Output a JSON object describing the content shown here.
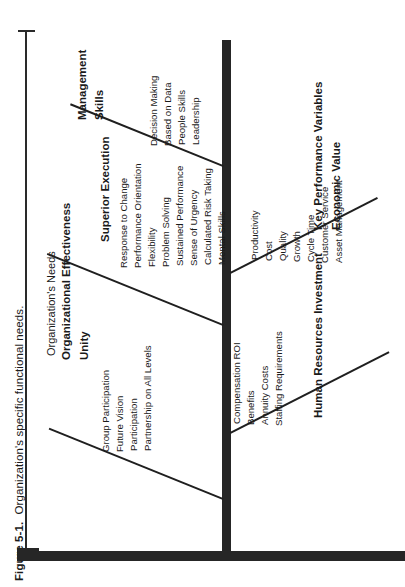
{
  "caption": {
    "figure_label": "Figure 5-1.",
    "text": "Organization's specific functional needs."
  },
  "bracket": {
    "label": "Organization's Needs"
  },
  "diagram": {
    "type": "fishbone",
    "orientation": "rotated-90-ccw",
    "groups": [
      {
        "id": "organizational-effectiveness",
        "header": "Organizational Effectiveness",
        "side": "left",
        "branches": [
          {
            "id": "management-skills",
            "title_line1": "Management",
            "title_line2": "Skills",
            "items": [
              "Decision Making",
              "Based on Data",
              "People Skills",
              "Leadership"
            ]
          },
          {
            "id": "superior-execution",
            "title_line1": "Superior Execution",
            "title_line2": "",
            "items": [
              "Response to Change",
              "Performance Orientation",
              "Flexibility",
              "Problem Solving",
              "Sustained Performance",
              "Sense of Urgency",
              "Calculated Risk Taking",
              "Mental Skills"
            ]
          },
          {
            "id": "unity",
            "title_line1": "Unity",
            "title_line2": "",
            "items": [
              "Group Participation",
              "Future Vision",
              "Participation",
              "Partnership on All Levels"
            ]
          }
        ]
      },
      {
        "id": "key-performance-variables",
        "header": "Key Performance Variables",
        "side": "right",
        "branches": [
          {
            "id": "economic-value",
            "title_line1": "Key Performance Variables",
            "title_line2": "Economic Value",
            "items": [
              "Productivity",
              "Cost",
              "Quality",
              "Growth",
              "Cycle Time",
              "Customer Service",
              "Asset Management"
            ]
          },
          {
            "id": "human-resources-investment",
            "title_line1": "Human Resources Investment",
            "title_line2": "",
            "items": [
              "Compensation ROI",
              "Benefits",
              "Annuity Costs",
              "Staffing Requirements"
            ]
          }
        ]
      }
    ]
  },
  "colors": {
    "ink": "#262626",
    "rule": "#1f1f1f",
    "background": "#ffffff"
  }
}
